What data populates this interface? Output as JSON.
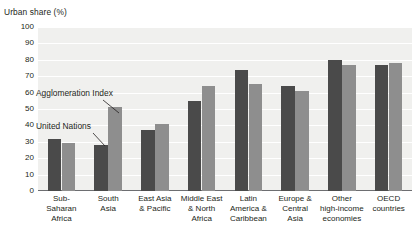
{
  "chart_data": {
    "type": "bar",
    "title": "Urban share (%)",
    "xlabel": "",
    "ylabel": "Urban share (%)",
    "ylim": [
      0,
      100
    ],
    "ytick_step": 10,
    "yticks": [
      100,
      90,
      80,
      70,
      60,
      50,
      40,
      30,
      20,
      10,
      0
    ],
    "grid": true,
    "legend_position": "annotations-inline",
    "categories": [
      "Sub-Saharan Africa",
      "South Asia",
      "East Asia & Pacific",
      "Middle East & North Africa",
      "Latin America & Caribbean",
      "Europe & Central Asia",
      "Other high-income economies",
      "OECD countries"
    ],
    "category_label_lines": [
      [
        "Sub-Saharan",
        "Africa"
      ],
      [
        "South",
        "Asia"
      ],
      [
        "East Asia",
        "& Pacific"
      ],
      [
        "Middle East",
        "& North",
        "Africa"
      ],
      [
        "Latin",
        "America &",
        "Caribbean"
      ],
      [
        "Europe &",
        "Central",
        "Asia"
      ],
      [
        "Other",
        "high-income",
        "economies"
      ],
      [
        "OECD",
        "countries"
      ]
    ],
    "series": [
      {
        "name": "United Nations",
        "color": "#4a4a4a",
        "values": [
          32,
          28,
          37,
          55,
          74,
          64,
          80,
          77
        ]
      },
      {
        "name": "Agglomeration Index",
        "color": "#8e8e8e",
        "values": [
          29.5,
          51,
          41,
          64,
          65,
          61,
          77,
          78
        ]
      }
    ],
    "annotations": [
      {
        "label": "Agglomeration Index",
        "points_to_series": "Agglomeration Index",
        "points_to_category": "South Asia"
      },
      {
        "label": "United Nations",
        "points_to_series": "United Nations",
        "points_to_category": "South Asia"
      }
    ]
  },
  "colors": {
    "series_dark": "#4a4a4a",
    "series_light": "#8e8e8e",
    "plot_background": "#f0f0ee",
    "gridline": "#ffffff",
    "axis": "#6d6e71",
    "text": "#231f20"
  }
}
